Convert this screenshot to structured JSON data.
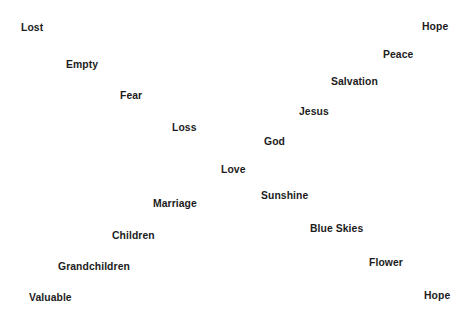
{
  "canvas": {
    "width": 476,
    "height": 323,
    "background_color": "#ffffff",
    "text_color": "#1c1c1c"
  },
  "chart_data": {
    "type": "scatter",
    "title": "",
    "subtitle": "",
    "xlabel": "",
    "ylabel": "",
    "grid": false,
    "legend": "none",
    "axis_visible": false,
    "xlim": [
      0,
      476
    ],
    "ylim": [
      0,
      323
    ],
    "note": "Two diverging diagonal bands of word labels on a blank white field; left band descends from upper-left to lower-left, right band descends from upper-right to lower-right, converging near the center.",
    "points": [
      {
        "label": "Lost",
        "x": 21,
        "y": 21
      },
      {
        "label": "Hope",
        "x": 422,
        "y": 20
      },
      {
        "label": "Empty",
        "x": 66,
        "y": 58
      },
      {
        "label": "Peace",
        "x": 383,
        "y": 48
      },
      {
        "label": "Salvation",
        "x": 331,
        "y": 75
      },
      {
        "label": "Fear",
        "x": 120,
        "y": 89
      },
      {
        "label": "Jesus",
        "x": 299,
        "y": 105
      },
      {
        "label": "Loss",
        "x": 172,
        "y": 121
      },
      {
        "label": "God",
        "x": 264,
        "y": 135
      },
      {
        "label": "Love",
        "x": 221,
        "y": 163
      },
      {
        "label": "Marriage",
        "x": 153,
        "y": 197
      },
      {
        "label": "Sunshine",
        "x": 261,
        "y": 189
      },
      {
        "label": "Children",
        "x": 112,
        "y": 229
      },
      {
        "label": "Blue Skies",
        "x": 310,
        "y": 222
      },
      {
        "label": "Grandchildren",
        "x": 58,
        "y": 260
      },
      {
        "label": "Flower",
        "x": 369,
        "y": 256
      },
      {
        "label": "Valuable",
        "x": 29,
        "y": 291
      },
      {
        "label": "Hope",
        "x": 424,
        "y": 289
      }
    ]
  }
}
